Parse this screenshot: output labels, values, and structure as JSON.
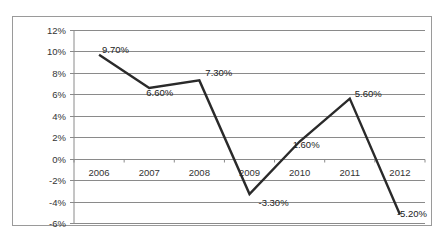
{
  "chart_data": {
    "type": "line",
    "title": "",
    "xlabel": "",
    "ylabel": "",
    "categories": [
      "2006",
      "2007",
      "2008",
      "2009",
      "2010",
      "2011",
      "2012"
    ],
    "series": [
      {
        "name": "Growth",
        "values": [
          9.7,
          6.6,
          7.3,
          -3.3,
          1.6,
          5.6,
          -5.2
        ],
        "labels": [
          "9.70%",
          "6.60%",
          "7.30%",
          "-3.30%",
          "1.60%",
          "5.60%",
          "-5.20%"
        ],
        "color": "#2a2a2a"
      }
    ],
    "ylim": [
      -6,
      12
    ],
    "yticks": [
      12,
      10,
      8,
      6,
      4,
      2,
      0,
      -2,
      -4,
      -6
    ],
    "ytick_labels": [
      "12%",
      "10%",
      "8%",
      "6%",
      "4%",
      "2%",
      "0%",
      "-2%",
      "-4%",
      "-6%"
    ],
    "grid": true,
    "legend": "none",
    "x_axis_position": "crosses at 0%"
  }
}
